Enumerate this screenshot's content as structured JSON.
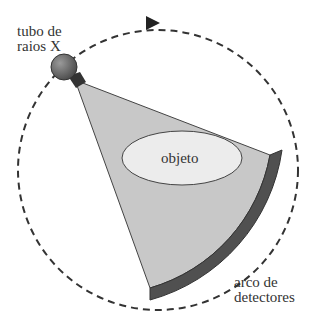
{
  "diagram": {
    "labels": {
      "tube": [
        "tubo de",
        "raios X"
      ],
      "object": "objeto",
      "detectors": [
        "arco de",
        "detectores"
      ]
    },
    "colors": {
      "fan": "#c8c8c8",
      "detector": "#505050",
      "object_fill": "#ececec",
      "tube": "#707070",
      "dashes": "#333333"
    }
  }
}
